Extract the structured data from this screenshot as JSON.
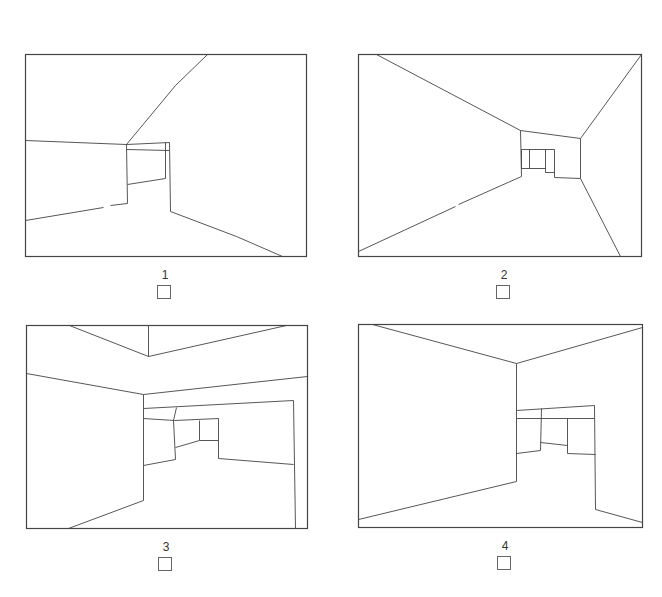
{
  "figure": {
    "stroke_color": "#444444",
    "background": "#ffffff",
    "panels": [
      {
        "id": 1,
        "label": "1",
        "frame": [
          25,
          54,
          306,
          256
        ],
        "lines": [
          [
            207,
            54,
            175,
            85,
            126,
            144
          ],
          [
            25,
            140,
            126,
            144
          ],
          [
            126,
            144,
            169,
            142
          ],
          [
            126,
            149,
            169,
            150
          ],
          [
            126,
            144,
            127,
            203
          ],
          [
            127,
            184,
            165,
            178
          ],
          [
            165,
            142,
            165,
            178
          ],
          [
            169,
            142,
            170,
            211
          ],
          [
            25,
            220,
            103,
            207
          ],
          [
            110,
            205,
            127,
            203
          ],
          [
            170,
            211,
            236,
            236,
            282,
            256
          ]
        ],
        "checkbox": {
          "x": 157,
          "y": 285
        }
      },
      {
        "id": 2,
        "label": "2",
        "frame": [
          358,
          54,
          641,
          256
        ],
        "lines": [
          [
            376,
            54,
            520,
            130
          ],
          [
            641,
            54,
            580,
            138
          ],
          [
            520,
            130,
            580,
            138
          ],
          [
            520,
            130,
            521,
            176
          ],
          [
            580,
            138,
            580,
            178
          ],
          [
            358,
            251,
            455,
            206
          ],
          [
            458,
            204,
            521,
            176
          ],
          [
            521,
            149,
            554,
            149
          ],
          [
            521,
            149,
            521,
            168
          ],
          [
            529,
            149,
            529,
            168
          ],
          [
            521,
            168,
            545,
            168
          ],
          [
            545,
            149,
            545,
            172
          ],
          [
            545,
            172,
            554,
            172
          ],
          [
            554,
            149,
            554,
            177
          ],
          [
            554,
            177,
            580,
            178
          ],
          [
            580,
            178,
            620,
            256
          ]
        ],
        "checkbox": {
          "x": 496,
          "y": 285
        }
      },
      {
        "id": 3,
        "label": "3",
        "frame": [
          26,
          325,
          307,
          528
        ],
        "lines": [
          [
            69,
            325,
            148,
            356
          ],
          [
            148,
            325,
            148,
            356
          ],
          [
            148,
            356,
            286,
            325
          ],
          [
            26,
            373,
            143,
            394
          ],
          [
            143,
            394,
            307,
            376
          ],
          [
            143,
            394,
            143,
            500
          ],
          [
            143,
            500,
            68,
            528
          ],
          [
            143,
            408,
            293,
            400
          ],
          [
            293,
            400,
            295,
            528
          ],
          [
            143,
            418,
            174,
            420
          ],
          [
            176,
            407,
            173,
            420
          ],
          [
            173,
            420,
            175,
            459
          ],
          [
            174,
            420,
            218,
            418
          ],
          [
            143,
            465,
            175,
            459
          ],
          [
            175,
            447,
            199,
            440
          ],
          [
            199,
            420,
            199,
            440
          ],
          [
            199,
            440,
            218,
            440
          ],
          [
            218,
            418,
            218,
            458
          ],
          [
            218,
            458,
            293,
            464
          ]
        ],
        "checkbox": {
          "x": 158,
          "y": 557
        }
      },
      {
        "id": 4,
        "label": "4",
        "frame": [
          358,
          324,
          642,
          527
        ],
        "lines": [
          [
            372,
            324,
            516,
            363
          ],
          [
            516,
            363,
            642,
            327
          ],
          [
            516,
            363,
            516,
            481
          ],
          [
            516,
            481,
            358,
            519
          ],
          [
            516,
            410,
            594,
            405
          ],
          [
            594,
            405,
            595,
            509
          ],
          [
            516,
            418,
            594,
            418
          ],
          [
            541,
            408,
            540,
            450
          ],
          [
            516,
            453,
            540,
            450
          ],
          [
            540,
            442,
            567,
            445
          ],
          [
            567,
            418,
            567,
            453
          ],
          [
            567,
            453,
            595,
            454
          ],
          [
            595,
            509,
            642,
            522
          ]
        ],
        "checkbox": {
          "x": 497,
          "y": 556
        }
      }
    ],
    "labels": [
      {
        "text": "1",
        "x": 150,
        "y": 268
      },
      {
        "text": "2",
        "x": 489,
        "y": 268
      },
      {
        "text": "3",
        "x": 151,
        "y": 540
      },
      {
        "text": "4",
        "x": 490,
        "y": 539
      }
    ]
  }
}
